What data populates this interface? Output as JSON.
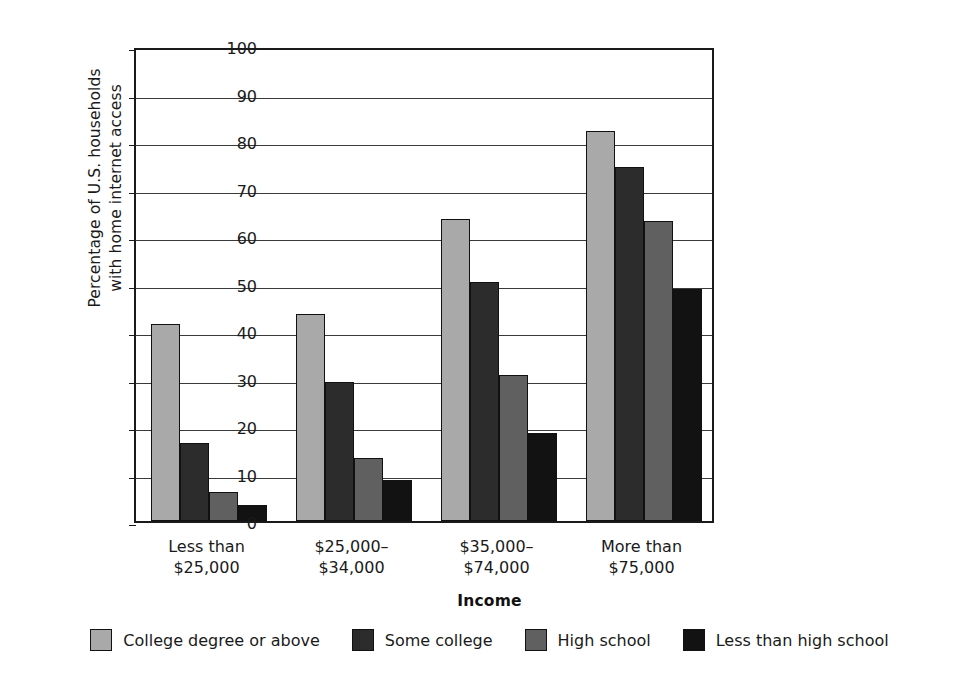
{
  "chart_data": {
    "type": "bar",
    "title": "",
    "subtitle": "",
    "xlabel": "Income",
    "ylabel": "Percentage of U.S. households with home internet access",
    "ylabel_lines": [
      "Percentage of U.S. households",
      "with home internet access"
    ],
    "ylim": [
      0,
      100
    ],
    "ytick_step": 10,
    "yticks": [
      "0",
      "10",
      "20",
      "30",
      "40",
      "50",
      "60",
      "70",
      "80",
      "90",
      "100"
    ],
    "grid": true,
    "grid_axis": "y",
    "legend_position": "bottom",
    "categories": [
      "Less than $25,000",
      "$25,000–$34,000",
      "$35,000–$74,000",
      "More than $75,000"
    ],
    "category_lines": [
      [
        "Less than",
        "$25,000"
      ],
      [
        "$25,000–",
        "$34,000"
      ],
      [
        "$35,000–",
        "$74,000"
      ],
      [
        "More than",
        "$75,000"
      ]
    ],
    "series": [
      {
        "name": "College degree or above",
        "color": "#a9a9a9",
        "values": [
          41.5,
          43.6,
          63.5,
          82.1
        ]
      },
      {
        "name": "Some college",
        "color": "#2c2c2c",
        "values": [
          16.5,
          29.2,
          50.4,
          74.5
        ]
      },
      {
        "name": "High school",
        "color": "#606060",
        "values": [
          6.2,
          13.2,
          30.7,
          63.2
        ]
      },
      {
        "name": "Less than high school",
        "color": "#121212",
        "values": [
          3.4,
          8.7,
          18.6,
          48.9
        ]
      }
    ]
  },
  "legend": {
    "items": [
      {
        "label": "College degree or above",
        "color": "#a9a9a9"
      },
      {
        "label": "Some college",
        "color": "#2c2c2c"
      },
      {
        "label": "High school",
        "color": "#606060"
      },
      {
        "label": "Less than high school",
        "color": "#121212"
      }
    ]
  },
  "axis_title": {
    "x": "Income"
  }
}
